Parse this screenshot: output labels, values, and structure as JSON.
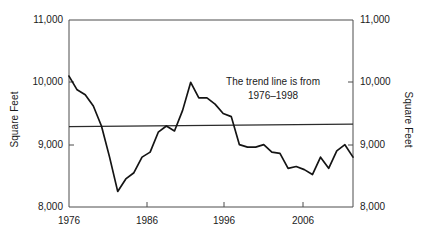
{
  "chart_data": {
    "type": "line",
    "title": "",
    "xlabel": "",
    "ylabel": "Square Feet",
    "ylabel_right": "Square Feet",
    "xlim": [
      1976,
      2011
    ],
    "ylim": [
      8000,
      11000
    ],
    "grid": false,
    "legend": "none",
    "yticks": [
      8000,
      9000,
      10000,
      11000
    ],
    "ytick_labels": [
      "8,000",
      "9,000",
      "10,000",
      "11,000"
    ],
    "ytick_labels_right": [
      "8,000",
      "9,000",
      "10,000",
      "11,000"
    ],
    "xticks": [
      1976,
      1986,
      1996,
      2006
    ],
    "xtick_labels": [
      "1976",
      "1986",
      "1996",
      "2006"
    ],
    "annotations": [
      {
        "text_line1": "The trend line is from",
        "text_line2": "1976–1998",
        "x": 1996,
        "y": 9750
      }
    ],
    "series": [
      {
        "name": "Square Feet",
        "x": [
          1976,
          1977,
          1978,
          1979,
          1980,
          1981,
          1982,
          1983,
          1984,
          1985,
          1986,
          1987,
          1988,
          1989,
          1990,
          1991,
          1992,
          1993,
          1994,
          1995,
          1996,
          1997,
          1998,
          1999,
          2000,
          2001,
          2002,
          2003,
          2004,
          2005,
          2006,
          2007,
          2008,
          2009,
          2010,
          2011
        ],
        "values": [
          10100,
          9880,
          9800,
          9620,
          9300,
          8800,
          8250,
          8450,
          8550,
          8800,
          8880,
          9200,
          9300,
          9220,
          9550,
          10000,
          9750,
          9750,
          9650,
          9500,
          9450,
          9000,
          8960,
          8960,
          9000,
          8880,
          8860,
          8620,
          8650,
          8600,
          8520,
          8800,
          8620,
          8900,
          9000,
          8800
        ]
      },
      {
        "name": "Trend line 1976-1998",
        "x": [
          1976,
          2011
        ],
        "values": [
          9290,
          9330
        ]
      }
    ]
  },
  "axes": {
    "left_title": "Square Feet",
    "right_title": "Square Feet"
  }
}
